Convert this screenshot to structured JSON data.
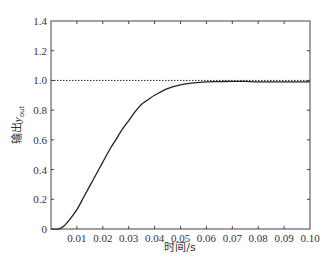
{
  "chart_data": {
    "type": "line",
    "title": "",
    "xlabel": "时间/s",
    "ylabel": "输出y_out",
    "ylabel_main": "输出",
    "ylabel_var": "y",
    "ylabel_sub": "out",
    "xlim": [
      0,
      0.1
    ],
    "ylim": [
      0,
      1.4
    ],
    "grid": false,
    "legend": null,
    "x_ticks": [
      0.01,
      0.02,
      0.03,
      0.04,
      0.05,
      0.06,
      0.07,
      0.08,
      0.09,
      0.1
    ],
    "x_tick_labels": [
      "0.01",
      "0.02",
      "0.03",
      "0.04",
      "0.05",
      "0.06",
      "0.07",
      "0.08",
      "0.09",
      "0.10"
    ],
    "y_ticks": [
      0,
      0.2,
      0.4,
      0.6,
      0.8,
      1.0,
      1.2,
      1.4
    ],
    "y_tick_labels": [
      "0",
      "0.2",
      "0.4",
      "0.6",
      "0.8",
      "1.0",
      "1.2",
      "1.4"
    ],
    "series": [
      {
        "name": "output y_out",
        "style": "solid",
        "color": "#222222",
        "x": [
          0,
          0.003,
          0.005,
          0.0075,
          0.01,
          0.0125,
          0.015,
          0.0175,
          0.02,
          0.0225,
          0.025,
          0.0275,
          0.03,
          0.0325,
          0.035,
          0.0375,
          0.04,
          0.045,
          0.05,
          0.055,
          0.06,
          0.065,
          0.07,
          0.075,
          0.08,
          0.09,
          0.1
        ],
        "y": [
          0,
          0.0,
          0.02,
          0.07,
          0.13,
          0.21,
          0.29,
          0.37,
          0.45,
          0.53,
          0.6,
          0.67,
          0.73,
          0.79,
          0.84,
          0.87,
          0.9,
          0.945,
          0.97,
          0.983,
          0.99,
          0.992,
          0.994,
          0.993,
          0.99,
          0.99,
          0.99
        ]
      },
      {
        "name": "reference",
        "style": "dotted",
        "color": "#333333",
        "x": [
          0,
          0.1
        ],
        "y": [
          1.0,
          1.0
        ]
      }
    ]
  }
}
